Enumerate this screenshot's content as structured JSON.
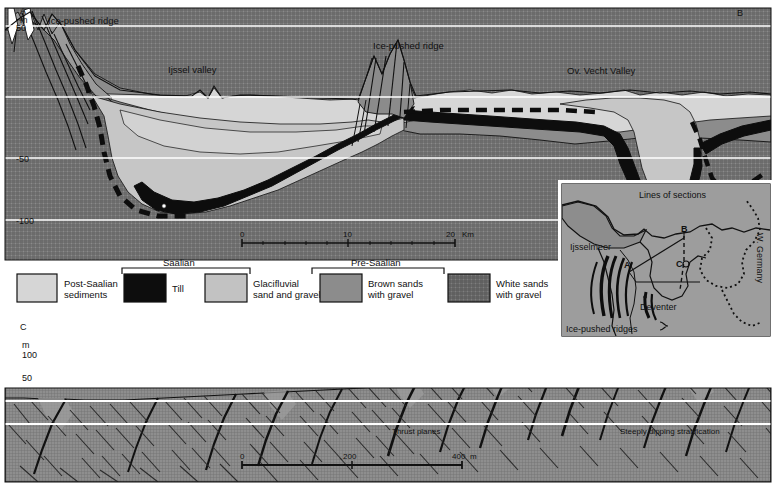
{
  "figure": {
    "type": "geological-cross-section",
    "sections": [
      {
        "id": "AB",
        "left_label": "A",
        "right_label": "B",
        "unit_label": "m",
        "axis_ticks": [
          "50",
          "0",
          "-50",
          "-100"
        ],
        "annotations": [
          {
            "text": "Ice-pushed ridge",
            "x": 48,
            "y": 20
          },
          {
            "text": "Ijssel valley",
            "x": 168,
            "y": 70
          },
          {
            "text": "Ice-pushed ridge",
            "x": 373,
            "y": 46
          },
          {
            "text": "Ov. Vecht Valley",
            "x": 567,
            "y": 71
          }
        ],
        "scale": {
          "ticks": [
            "0",
            "10",
            "20"
          ],
          "unit": "Km"
        }
      },
      {
        "id": "C",
        "left_label": "C",
        "unit_label": "m",
        "axis_ticks": [
          "100",
          "50",
          "0",
          "-50"
        ],
        "annotations": [
          {
            "text": "Thrust planes",
            "x": 392,
            "y": 432
          },
          {
            "text": "Steeply dipping stratification",
            "x": 620,
            "y": 432
          }
        ],
        "scale": {
          "ticks": [
            "0",
            "200",
            "400"
          ],
          "unit": "m"
        }
      }
    ]
  },
  "legend": {
    "groups": [
      {
        "label": "Saalian"
      },
      {
        "label": "Pre-Saalian"
      }
    ],
    "items": [
      {
        "label_line1": "Post-Saalian",
        "label_line2": "sediments",
        "fill": "#d6d6d6",
        "pattern": "solid"
      },
      {
        "label_line1": "Till",
        "label_line2": "",
        "fill": "#0d0d0d",
        "pattern": "solid"
      },
      {
        "label_line1": "Glacifluvial",
        "label_line2": "sand and gravel",
        "fill": "#c2c2c2",
        "pattern": "solid"
      },
      {
        "label_line1": "Brown sands",
        "label_line2": "with gravel",
        "fill": "#8c8c8c",
        "pattern": "solid"
      },
      {
        "label_line1": "White sands",
        "label_line2": "with gravel",
        "fill": "#7d7d7d",
        "pattern": "crosshatch"
      }
    ]
  },
  "inset_map": {
    "title": "Lines of sections",
    "labels": [
      {
        "text": "Ijsselmeer",
        "x": 573,
        "y": 247
      },
      {
        "text": "W. Germany",
        "x": 757,
        "y": 233
      },
      {
        "text": "Deventer",
        "x": 643,
        "y": 305
      },
      {
        "text": "Ice-pushed ridges",
        "x": 566,
        "y": 329
      },
      {
        "text": "A",
        "x": 627,
        "y": 267
      },
      {
        "text": "B",
        "x": 684,
        "y": 231
      },
      {
        "text": "C",
        "x": 679,
        "y": 261
      }
    ],
    "background": "#9a9a9a",
    "land": "#8a8a8a"
  },
  "colors": {
    "post_saalian": "#d6d6d6",
    "till": "#0d0d0d",
    "glacifluvial": "#c2c2c2",
    "brown_sands": "#8c8c8c",
    "white_sands": "#7d7d7d",
    "gridline": "#ffffff",
    "outline": "#101010",
    "page": "#ffffff"
  }
}
